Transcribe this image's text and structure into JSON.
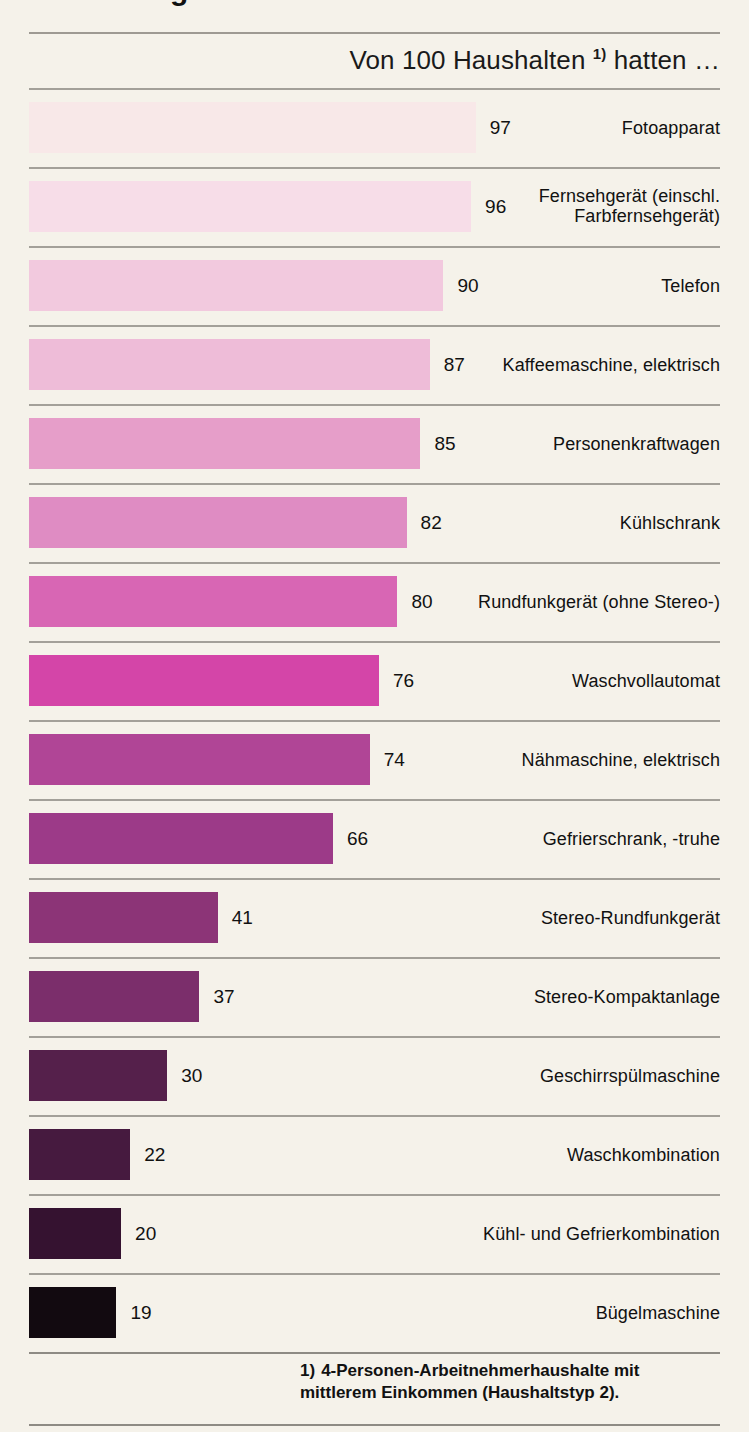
{
  "page": {
    "clipped_title_fragment": "g",
    "background_color": "#f5f2ea",
    "footnote_marker": "1)",
    "footnote_text": "4-Personen-Arbeitnehmerhaushalte mit mittlerem Einkommen (Haushaltstyp 2)."
  },
  "header": {
    "caption_before": "Von 100 Haushalten ",
    "caption_marker": "1)",
    "caption_after": " hatten …"
  },
  "chart_data": {
    "type": "bar",
    "orientation": "horizontal",
    "title": "Von 100 Haushalten 1) hatten …",
    "subtitle": "",
    "xlabel": "",
    "ylabel": "",
    "xlim": [
      0,
      100
    ],
    "grid": false,
    "legend": "none",
    "value_unit": "von 100 Haushalten",
    "categories": [
      "Fotoapparat",
      "Fernsehgerät (einschl.\nFarbfernsehgerät)",
      "Telefon",
      "Kaffeemaschine, elektrisch",
      "Personenkraftwagen",
      "Kühlschrank",
      "Rundfunkgerät (ohne Stereo-)",
      "Waschvollautomat",
      "Nähmaschine, elektrisch",
      "Gefrierschrank, -truhe",
      "Stereo-Rundfunkgerät",
      "Stereo-Kompaktanlage",
      "Geschirrspülmaschine",
      "Waschkombination",
      "Kühl- und Gefrierkombination",
      "Bügelmaschine"
    ],
    "values": [
      97,
      96,
      90,
      87,
      85,
      82,
      80,
      76,
      74,
      66,
      41,
      37,
      30,
      22,
      20,
      19
    ],
    "colors": [
      "#f8e8e8",
      "#f7dde8",
      "#f2c9de",
      "#eebcd8",
      "#e69ec9",
      "#df8cc3",
      "#d866b4",
      "#d445a8",
      "#b04596",
      "#9c3a88",
      "#8c3477",
      "#7b2e6b",
      "#55204b",
      "#461a3f",
      "#351230",
      "#120a10"
    ],
    "footnote": "1) 4-Personen-Arbeitnehmerhaushalte mit mittlerem Einkommen (Haushaltstyp 2)."
  },
  "rows": [
    {
      "label": "Fotoapparat",
      "value": "97",
      "color": "#f8e8e8"
    },
    {
      "label": "Fernsehgerät (einschl.\nFarbfernsehgerät)",
      "value": "96",
      "color": "#f7dde8"
    },
    {
      "label": "Telefon",
      "value": "90",
      "color": "#f2c9de"
    },
    {
      "label": "Kaffeemaschine, elektrisch",
      "value": "87",
      "color": "#eebcd8"
    },
    {
      "label": "Personenkraftwagen",
      "value": "85",
      "color": "#e69ec9"
    },
    {
      "label": "Kühlschrank",
      "value": "82",
      "color": "#df8cc3"
    },
    {
      "label": "Rundfunkgerät (ohne Stereo-)",
      "value": "80",
      "color": "#d866b4"
    },
    {
      "label": "Waschvollautomat",
      "value": "76",
      "color": "#d445a8"
    },
    {
      "label": "Nähmaschine, elektrisch",
      "value": "74",
      "color": "#b04596"
    },
    {
      "label": "Gefrierschrank, -truhe",
      "value": "66",
      "color": "#9c3a88"
    },
    {
      "label": "Stereo-Rundfunkgerät",
      "value": "41",
      "color": "#8c3477"
    },
    {
      "label": "Stereo-Kompaktanlage",
      "value": "37",
      "color": "#7b2e6b"
    },
    {
      "label": "Geschirrspülmaschine",
      "value": "30",
      "color": "#55204b"
    },
    {
      "label": "Waschkombination",
      "value": "22",
      "color": "#461a3f"
    },
    {
      "label": "Kühl- und Gefrierkombination",
      "value": "20",
      "color": "#351230"
    },
    {
      "label": "Bügelmaschine",
      "value": "19",
      "color": "#120a10"
    }
  ]
}
